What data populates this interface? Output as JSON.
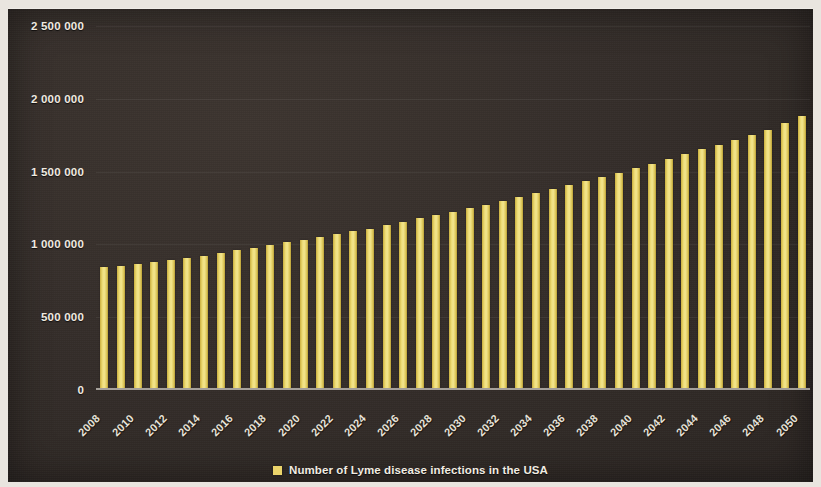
{
  "chart_data": {
    "type": "bar",
    "title": "",
    "subtitle": "",
    "xlabel": "",
    "ylabel": "",
    "ylim": [
      0,
      2500000
    ],
    "y_ticks": [
      "0",
      "500 000",
      "1 000 000",
      "1 500 000",
      "2 000 000",
      "2 500 000"
    ],
    "y_tick_values": [
      0,
      500000,
      1000000,
      1500000,
      2000000,
      2500000
    ],
    "grid": true,
    "grid_axis": "y",
    "legend_position": "bottom-center",
    "bar_color": "#ead36a",
    "background_color": "#342d29",
    "text_color": "#efeae0",
    "x_tick_step": 2,
    "x_tick_labels": [
      "2008",
      "2010",
      "2012",
      "2014",
      "2016",
      "2018",
      "2020",
      "2022",
      "2024",
      "2026",
      "2028",
      "2030",
      "2032",
      "2034",
      "2036",
      "2038",
      "2040",
      "2042",
      "2044",
      "2046",
      "2048",
      "2050"
    ],
    "categories": [
      "2008",
      "2009",
      "2010",
      "2011",
      "2012",
      "2013",
      "2014",
      "2015",
      "2016",
      "2017",
      "2018",
      "2019",
      "2020",
      "2021",
      "2022",
      "2023",
      "2024",
      "2025",
      "2026",
      "2027",
      "2028",
      "2029",
      "2030",
      "2031",
      "2032",
      "2033",
      "2034",
      "2035",
      "2036",
      "2037",
      "2038",
      "2039",
      "2040",
      "2041",
      "2042",
      "2043",
      "2044",
      "2045",
      "2046",
      "2047",
      "2048",
      "2049",
      "2050"
    ],
    "series": [
      {
        "name": "Number of Lyme disease infections in the USA",
        "values": [
          830000,
          840000,
          855000,
          865000,
          880000,
          895000,
          910000,
          925000,
          945000,
          960000,
          980000,
          1000000,
          1015000,
          1035000,
          1055000,
          1075000,
          1095000,
          1120000,
          1140000,
          1165000,
          1185000,
          1210000,
          1235000,
          1260000,
          1285000,
          1310000,
          1340000,
          1365000,
          1395000,
          1420000,
          1450000,
          1480000,
          1510000,
          1540000,
          1575000,
          1605000,
          1640000,
          1670000,
          1705000,
          1740000,
          1775000,
          1820000,
          1870000
        ]
      }
    ],
    "legend": [
      {
        "label": "Number of Lyme disease infections in the USA",
        "color": "#ead36a"
      }
    ]
  }
}
